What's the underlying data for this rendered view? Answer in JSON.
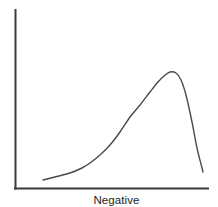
{
  "chart_data": {
    "type": "line",
    "title": "",
    "subtitle": "",
    "xlabel": "Negative",
    "ylabel": "",
    "legend": [],
    "annotations": [],
    "grid": false,
    "legend_position": "none",
    "axes": {
      "x_axis_visible": true,
      "y_axis_visible": true,
      "x_ticks": [],
      "y_ticks": [],
      "xlim": [
        0,
        100
      ],
      "ylim": [
        0,
        100
      ],
      "spine_color": "#3a3a3a"
    },
    "series": [
      {
        "name": "distribution",
        "color": "#4a4a4a",
        "description": "left-skewed unimodal density curve rising gradually from the left, peaking near the right, then dropping steeply",
        "x": [
          14,
          20,
          25,
          30,
          35,
          39,
          44,
          49,
          54,
          59,
          64,
          69,
          74,
          78,
          80,
          82,
          85,
          88,
          91,
          94,
          97
        ],
        "y": [
          4,
          6,
          8,
          11,
          15,
          19,
          24,
          31,
          38,
          47,
          56,
          66,
          77,
          88,
          94,
          98,
          96,
          84,
          62,
          35,
          14
        ]
      }
    ],
    "path_points_px": {
      "note": "approximate pixel coordinates of the plotted curve in a 218x207 canvas",
      "points": [
        [
          43,
          180
        ],
        [
          55,
          177
        ],
        [
          70,
          173
        ],
        [
          82,
          168
        ],
        [
          90,
          163
        ],
        [
          100,
          155
        ],
        [
          110,
          145
        ],
        [
          120,
          132
        ],
        [
          130,
          117
        ],
        [
          140,
          105
        ],
        [
          150,
          92
        ],
        [
          158,
          82
        ],
        [
          164,
          76
        ],
        [
          170,
          72
        ],
        [
          176,
          73
        ],
        [
          181,
          80
        ],
        [
          186,
          95
        ],
        [
          192,
          122
        ],
        [
          197,
          148
        ],
        [
          201,
          164
        ],
        [
          203,
          172
        ]
      ]
    }
  },
  "figure": {
    "background_color": "#ffffff",
    "width_px": 218,
    "height_px": 207
  }
}
